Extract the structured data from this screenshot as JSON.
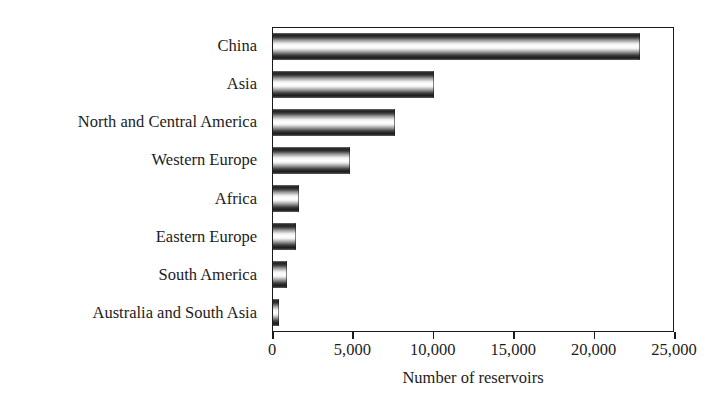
{
  "chart_data": {
    "type": "bar",
    "orientation": "horizontal",
    "title": "",
    "subtitle": "",
    "xlabel": "Number of reservoirs",
    "ylabel": "",
    "categories": [
      "China",
      "Asia",
      "North and Central America",
      "Western Europe",
      "Africa",
      "Eastern Europe",
      "South America",
      "Australia and South Asia"
    ],
    "values": [
      22800,
      10000,
      7600,
      4800,
      1600,
      1450,
      900,
      400
    ],
    "xlim": [
      0,
      25000
    ],
    "ylim": [
      0,
      8
    ],
    "xticks": [
      0,
      5000,
      10000,
      15000,
      20000,
      25000
    ],
    "xticklabels": [
      "0",
      "5,000",
      "10,000",
      "15,000",
      "20,000",
      "25,000"
    ],
    "grid": false,
    "legend": null,
    "legend_position": "none",
    "bar_style": "gradient-cylinder",
    "colors": {
      "bar_dark": "#1a1a1a",
      "bar_light": "#ffffff",
      "axis": "#1a1a1a",
      "text": "#1c1c1c",
      "background": "#ffffff"
    }
  }
}
